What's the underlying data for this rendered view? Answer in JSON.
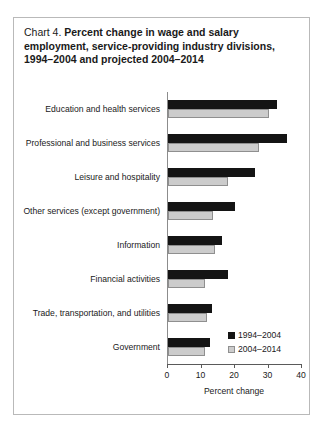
{
  "title": {
    "prefix": "Chart 4.",
    "main": "Percent change in wage and salary employment, service-providing industry divisions, 1994–2004 and projected 2004–2014"
  },
  "chart_data": {
    "type": "bar",
    "orientation": "horizontal",
    "title": "Chart 4. Percent change in wage and salary employment, service-providing industry divisions, 1994–2004 and projected 2004–2014",
    "xlabel": "Percent change",
    "ylabel": "",
    "xlim": [
      0,
      40
    ],
    "xticks": [
      0,
      10,
      20,
      30,
      40
    ],
    "xticklabels": [
      "0",
      "10",
      "20",
      "30",
      "40"
    ],
    "grid": false,
    "legend_position": "bottom-right",
    "categories": [
      "Education and health services",
      "Professional and business services",
      "Leisure and hospitality",
      "Other services (except government)",
      "Information",
      "Financial activities",
      "Trade, transportation, and utilities",
      "Government"
    ],
    "series": [
      {
        "name": "1994–2004",
        "color": "#141414",
        "values": [
          32.4,
          35.4,
          26.0,
          20.0,
          16.0,
          18.0,
          13.0,
          12.5
        ]
      },
      {
        "name": "2004–2014",
        "color": "#cccccc",
        "values": [
          30.0,
          27.3,
          18.0,
          13.5,
          14.0,
          11.0,
          11.5,
          11.0
        ]
      }
    ]
  }
}
